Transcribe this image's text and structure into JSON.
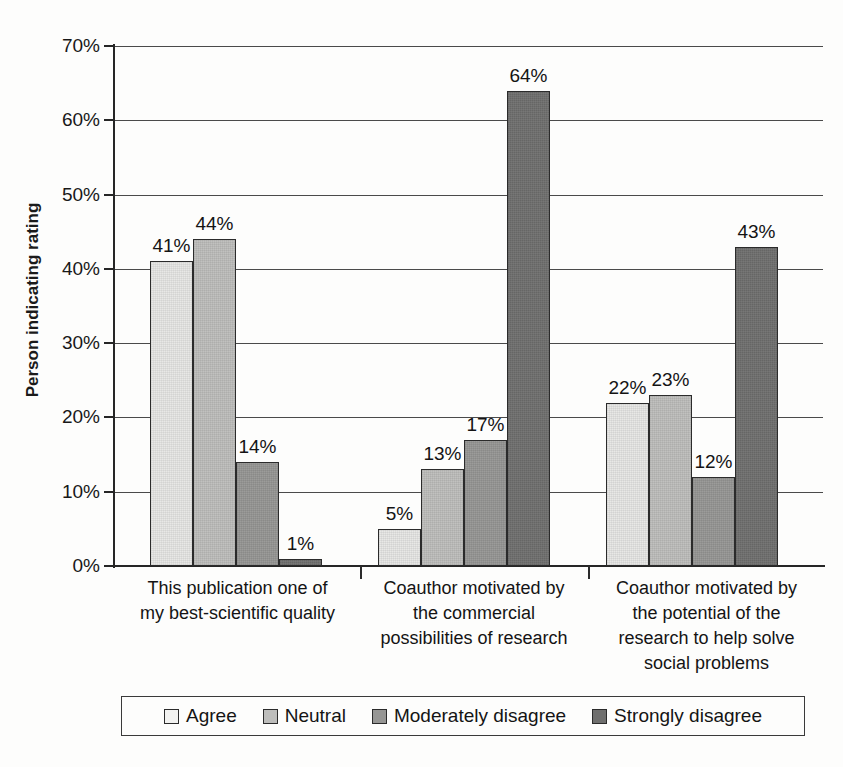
{
  "chart_data": {
    "type": "bar",
    "title": "",
    "xlabel": "",
    "ylabel": "Person indicating rating",
    "ylim": [
      0,
      70
    ],
    "grid": true,
    "legend_position": "bottom",
    "value_suffix": "%",
    "yticks": [
      "0%",
      "10%",
      "20%",
      "30%",
      "40%",
      "50%",
      "60%",
      "70%"
    ],
    "ytick_values": [
      0,
      10,
      20,
      30,
      40,
      50,
      60,
      70
    ],
    "categories": [
      "This publication one of my best-scientific quality",
      "Coauthor motivated by the commercial possibilities of research",
      "Coauthor motivated by the potential of the research to help solve social problems"
    ],
    "category_lines": [
      [
        "This publication one of",
        "my best-scientific quality"
      ],
      [
        "Coauthor motivated by",
        "the commercial",
        "possibilities of research"
      ],
      [
        "Coauthor motivated by",
        "the potential of the",
        "research to help solve",
        "social problems"
      ]
    ],
    "series": [
      {
        "name": "Agree",
        "color": "#e6e6e4",
        "values": [
          41,
          5,
          22
        ],
        "labels": [
          "41%",
          "5%",
          "22%"
        ]
      },
      {
        "name": "Neutral",
        "color": "#bdbdbb",
        "values": [
          44,
          13,
          23
        ],
        "labels": [
          "44%",
          "13%",
          "23%"
        ]
      },
      {
        "name": "Moderately disagree",
        "color": "#969694",
        "values": [
          14,
          17,
          12
        ],
        "labels": [
          "14%",
          "17%",
          "12%"
        ]
      },
      {
        "name": "Strongly disagree",
        "color": "#6f6f6e",
        "values": [
          1,
          64,
          43
        ],
        "labels": [
          "1%",
          "64%",
          "43%"
        ]
      }
    ]
  },
  "legend": {
    "items": [
      {
        "label": "Agree"
      },
      {
        "label": "Neutral"
      },
      {
        "label": "Moderately disagree"
      },
      {
        "label": "Strongly disagree"
      }
    ]
  }
}
